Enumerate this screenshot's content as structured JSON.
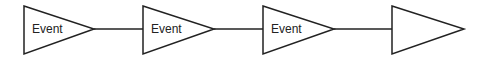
{
  "diagram": {
    "type": "flow",
    "direction": "left-to-right",
    "nodes": [
      {
        "id": "n1",
        "shape": "triangle-right",
        "label": "Event"
      },
      {
        "id": "n2",
        "shape": "triangle-right",
        "label": "Event"
      },
      {
        "id": "n3",
        "shape": "triangle-right",
        "label": "Event"
      },
      {
        "id": "n4",
        "shape": "triangle-right",
        "label": ""
      }
    ],
    "edges": [
      {
        "from": "n1",
        "to": "n2"
      },
      {
        "from": "n2",
        "to": "n3"
      },
      {
        "from": "n3",
        "to": "n4"
      }
    ],
    "colors": {
      "stroke": "#222222",
      "fill": "#ffffff"
    }
  }
}
